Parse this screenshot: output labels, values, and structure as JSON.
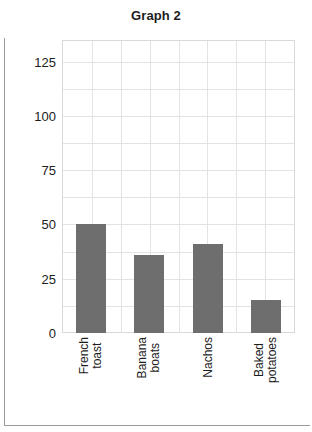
{
  "page": {
    "background_color": "#ffffff",
    "frame_color": "#9a9a9a"
  },
  "chart_data": {
    "type": "bar",
    "title": "Graph 2",
    "xlabel": "",
    "ylabel": "",
    "categories": [
      "French toast",
      "Banana boats",
      "Nachos",
      "Baked potatoes"
    ],
    "category_lines": [
      [
        "French",
        "toast"
      ],
      [
        "Banana",
        "boats"
      ],
      [
        "Nachos"
      ],
      [
        "Baked",
        "potatoes"
      ]
    ],
    "values": [
      50,
      36,
      41,
      15
    ],
    "ylim": [
      0,
      135
    ],
    "yticks": [
      0,
      25,
      50,
      75,
      100,
      125
    ],
    "ytick_labels": [
      "0",
      "25",
      "50",
      "75",
      "100",
      "125"
    ],
    "grid": true,
    "grid_minor_step": 12.5,
    "grid_vertical_count": 8,
    "legend": "none",
    "bar_color": "#6e6e6e",
    "grid_color": "#e3e3e3",
    "axis_color": "#d9d9d9",
    "text_color": "#1c1c1c"
  }
}
